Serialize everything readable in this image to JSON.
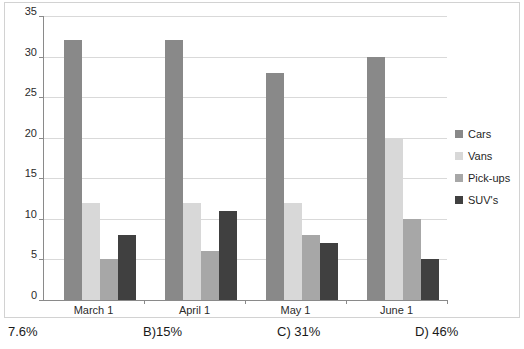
{
  "chart_data": {
    "type": "bar",
    "title": "",
    "xlabel": "",
    "ylabel": "",
    "ylim": [
      0,
      35
    ],
    "yticks": [
      0,
      5,
      10,
      15,
      20,
      25,
      30,
      35
    ],
    "ytick_labels": [
      "0",
      "5",
      "10",
      "15",
      "20",
      "25",
      "30",
      "35"
    ],
    "grid": true,
    "legend_position": "right",
    "categories": [
      "March 1",
      "April 1",
      "May 1",
      "June 1"
    ],
    "series": [
      {
        "name": "Cars",
        "color": "#898989",
        "values": [
          32,
          32,
          28,
          30
        ]
      },
      {
        "name": "Vans",
        "color": "#d8d8d8",
        "values": [
          12,
          12,
          12,
          20
        ]
      },
      {
        "name": "Pick-ups",
        "color": "#a7a7a7",
        "values": [
          5,
          6,
          8,
          10
        ]
      },
      {
        "name": "SUV's",
        "color": "#404040",
        "values": [
          8,
          11,
          7,
          5
        ]
      }
    ]
  },
  "legend": {
    "items": [
      {
        "label": "Cars"
      },
      {
        "label": "Vans"
      },
      {
        "label": "Pick-ups"
      },
      {
        "label": "SUV's"
      }
    ]
  },
  "answer_options": [
    {
      "label": "7.6%"
    },
    {
      "label": "B)15%"
    },
    {
      "label": "C) 31%"
    },
    {
      "label": "D) 46%"
    }
  ]
}
